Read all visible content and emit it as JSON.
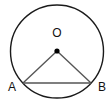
{
  "diagram": {
    "type": "circle-geometry",
    "stroke_color": "#1a1a1a",
    "chord_color": "#555555",
    "circle": {
      "cx": 57,
      "cy": 51.5,
      "r": 46.5
    },
    "center": {
      "label": "O",
      "x": 57,
      "y": 51,
      "label_x": 57,
      "label_y": 37
    },
    "points": [
      {
        "label": "A",
        "x": 23,
        "y": 83,
        "label_x": 12,
        "label_y": 91
      },
      {
        "label": "B",
        "x": 91,
        "y": 83,
        "label_x": 102,
        "label_y": 91
      }
    ],
    "segments": [
      {
        "from": "O",
        "to": "A"
      },
      {
        "from": "O",
        "to": "B"
      },
      {
        "from": "A",
        "to": "B"
      }
    ]
  }
}
